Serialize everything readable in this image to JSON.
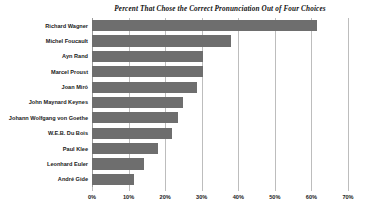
{
  "chart_data": {
    "type": "bar",
    "orientation": "horizontal",
    "title": "Percent That Chose the Correct Pronunciation Out of Four Choices",
    "xlabel": "",
    "ylabel": "",
    "xlim": [
      0,
      70
    ],
    "grid": true,
    "legend": false,
    "bar_color": "#6e6e6e",
    "gridline_color": "#bdbdbd",
    "xticks": [
      0,
      10,
      20,
      30,
      40,
      50,
      60,
      70
    ],
    "xtick_labels": [
      "0%",
      "10%",
      "20%",
      "30%",
      "40%",
      "50%",
      "60%",
      "70%"
    ],
    "categories": [
      "Richard Wagner",
      "Michel Foucault",
      "Ayn Rand",
      "Marcel Proust",
      "Joan Miró",
      "John Maynard Keynes",
      "Johann Wolfgang von Goethe",
      "W.E.B. Du Bois",
      "Paul Klee",
      "Leonhard Euler",
      "André Gide"
    ],
    "values": [
      61.5,
      38.0,
      30.3,
      30.3,
      28.7,
      25.0,
      23.5,
      22.0,
      18.0,
      14.2,
      11.5
    ]
  }
}
